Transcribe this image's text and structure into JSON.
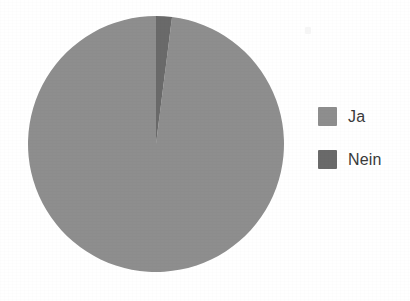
{
  "chart_data": {
    "type": "pie",
    "title": "",
    "subtitle": "",
    "xlabel": "",
    "ylabel": "",
    "grid": false,
    "legend_position": "right",
    "categories": [
      "Ja",
      "Nein"
    ],
    "values": [
      98,
      2
    ],
    "slices": [
      {
        "label": "Ja",
        "value": 98,
        "color": "#8e8e8e",
        "start_angle_deg": 2.5,
        "end_angle_deg": 360
      },
      {
        "label": "Nein",
        "value": 2,
        "color": "#6a6a6a",
        "start_angle_deg": 0,
        "end_angle_deg": 2.5
      }
    ],
    "units": "percent",
    "start_angle_deg": 0,
    "direction": "clockwise"
  },
  "pie": {
    "center_x": 156,
    "center_y": 144,
    "radius": 128,
    "slice_ja_name": "pie-slice-ja",
    "slice_nein_name": "pie-slice-nein"
  },
  "legend": {
    "items": [
      {
        "label": "Ja",
        "color": "#8e8e8e"
      },
      {
        "label": "Nein",
        "color": "#6a6a6a"
      }
    ]
  },
  "colors": {
    "background": "#ffffff",
    "slice_primary": "#8e8e8e",
    "slice_secondary": "#6a6a6a",
    "text": "#3a3a3a"
  }
}
